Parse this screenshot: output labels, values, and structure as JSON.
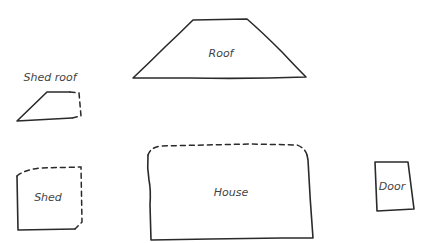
{
  "diagram": {
    "stroke_color": "#2a2a2a",
    "label_color": "#444444",
    "shapes": [
      {
        "id": "roof",
        "label": "Roof",
        "kind": "trapezoid",
        "label_pos": [
          221,
          53
        ]
      },
      {
        "id": "shed_roof",
        "label": "Shed roof",
        "kind": "quadrilateral",
        "label_pos": [
          50,
          77
        ]
      },
      {
        "id": "shed",
        "label": "Shed",
        "kind": "rectangle",
        "label_pos": [
          48,
          197
        ]
      },
      {
        "id": "house",
        "label": "House",
        "kind": "rectangle",
        "label_pos": [
          231,
          192
        ]
      },
      {
        "id": "door",
        "label": "Door",
        "kind": "rectangle",
        "label_pos": [
          392,
          186
        ]
      }
    ]
  }
}
